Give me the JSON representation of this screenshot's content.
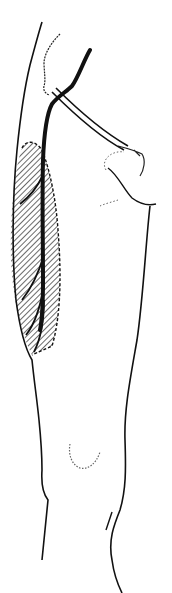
{
  "figure": {
    "width": 172,
    "height": 593,
    "colors": {
      "background": "#ffffff",
      "ink": "#111111",
      "hatch": "#1a1a1a",
      "dotted": "#555555"
    },
    "regions": [
      {
        "name": "hatched-area",
        "description": "diagonally hatched oval region along lateral thigh"
      },
      {
        "name": "thick-vessel",
        "description": "bold line running from groin down the thigh"
      },
      {
        "name": "graft-tube",
        "description": "tube crossing from groin to lower abdomen/hand region"
      },
      {
        "name": "knee-outline",
        "description": "dotted patella outline"
      }
    ]
  }
}
